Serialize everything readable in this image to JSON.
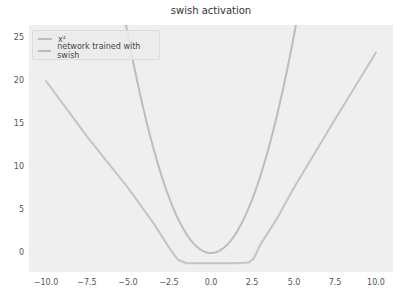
{
  "chart_data": {
    "type": "line",
    "title": "swish activation",
    "xlabel": "",
    "ylabel": "",
    "xlim": [
      -10.5,
      11.0
    ],
    "ylim": [
      -2.2,
      26.5
    ],
    "xticks": [
      "−10.0",
      "−7.5",
      "−5.0",
      "−2.5",
      "0.0",
      "2.5",
      "5.0",
      "7.5",
      "10.0"
    ],
    "yticks": [
      "0",
      "5",
      "10",
      "15",
      "20",
      "25"
    ],
    "grid": false,
    "legend_position": "upper left",
    "series": [
      {
        "name": "x²",
        "color": "#bdbdbd",
        "x": [
          -10,
          -9,
          -8,
          -7,
          -6,
          -5,
          -4,
          -3,
          -2,
          -1,
          0,
          1,
          2,
          3,
          4,
          5,
          6,
          7,
          8,
          9,
          10
        ],
        "y": [
          100,
          81,
          64,
          49,
          36,
          25,
          16,
          9,
          4,
          1,
          0,
          1,
          4,
          9,
          16,
          25,
          36,
          49,
          64,
          81,
          100
        ]
      },
      {
        "name": "network trained with swish",
        "color": "#c4c4c4",
        "x": [
          -10,
          -7.5,
          -5,
          -3.5,
          -2.5,
          -2,
          -1.5,
          0,
          1.5,
          2.3,
          2.6,
          3,
          4,
          5,
          7.5,
          10
        ],
        "y": [
          20.0,
          13.5,
          7.5,
          3.5,
          0.5,
          -0.8,
          -1.2,
          -1.2,
          -1.2,
          -1.1,
          -0.6,
          1.0,
          4.0,
          7.5,
          15.5,
          23.3
        ]
      }
    ]
  },
  "legend": {
    "items": [
      {
        "label": "x²"
      },
      {
        "label": "network trained with swish"
      }
    ]
  }
}
